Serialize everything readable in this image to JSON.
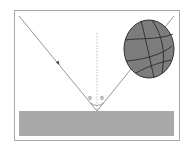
{
  "diagram": {
    "title": "",
    "angle_labels": [
      "θ",
      "θ"
    ],
    "colors": {
      "frame": "#a8a8a8",
      "ground": "#a9a9a9",
      "ray": "#8a8a8a",
      "normal": "#b0b0b0",
      "ball_fill": "#7d7d7d",
      "ball_seams": "#222222",
      "background": "#ffffff"
    },
    "elements": {
      "incident_ray": {
        "from": [
          19,
          16
        ],
        "to": [
          97,
          111
        ]
      },
      "reflected_ray": {
        "from": [
          97,
          111
        ],
        "to": [
          174,
          16
        ]
      },
      "normal_line": {
        "from": [
          97,
          33
        ],
        "to": [
          97,
          111
        ]
      },
      "ground": {
        "x": 19,
        "y": 111,
        "width": 155,
        "height": 25
      },
      "ball": {
        "cx": 149,
        "cy": 49,
        "rx": 25,
        "ry": 29
      },
      "arrow": {
        "x": 58,
        "y": 63
      }
    }
  }
}
